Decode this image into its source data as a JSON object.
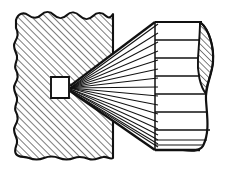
{
  "figure": {
    "canvas": {
      "width": 226,
      "height": 172,
      "background": "#ffffff"
    },
    "stroke_color": "#111111",
    "hatch_color": "#1a1a1a",
    "fill_color": "#ffffff",
    "parts": [
      {
        "name": "wall-block",
        "label": "Hatched wall section",
        "style": "section-hatch-45",
        "break_edges": [
          "top",
          "left",
          "bottom"
        ],
        "straight_edges": [
          "right"
        ],
        "bounds": {
          "x": 14,
          "y": 12,
          "width": 99,
          "height": 148
        }
      },
      {
        "name": "aperture",
        "label": "Rectangular aperture opening",
        "bounds": {
          "x": 51,
          "y": 77,
          "width": 18,
          "height": 21
        }
      },
      {
        "name": "ray-fan",
        "label": "Fan of rays diverging from aperture",
        "apex": {
          "x": 70,
          "y": 88
        },
        "ray_count": 17
      },
      {
        "name": "frustum-body",
        "label": "Cylindrical ribbed body",
        "bounds": {
          "x": 155,
          "y": 22,
          "width": 45,
          "height": 128
        },
        "rib_count": 7
      },
      {
        "name": "end-cap",
        "label": "Hatched elliptical cut section at far end",
        "style": "section-hatch-45"
      }
    ],
    "geometry": {
      "wall_right_edge_x": 113,
      "wall_top_y": 14,
      "wall_bottom_y": 158,
      "wall_left_x": 16,
      "apex_x": 70,
      "apex_y": 88,
      "aperture_left_x": 51,
      "aperture_right_x": 69,
      "aperture_top_y": 77,
      "aperture_bottom_y": 98,
      "cone_top_start_y": 22,
      "cone_bottom_start_y": 150,
      "body_left_x": 155,
      "body_right_x": 200,
      "cap_bulge_x": 214,
      "rib_y_values": [
        22,
        40,
        58,
        76,
        94,
        112,
        130,
        150
      ],
      "fan_end_y_values": [
        24,
        33,
        42,
        51,
        60,
        69,
        78,
        87,
        96,
        105,
        114,
        122,
        130,
        136,
        141,
        145,
        149
      ]
    }
  }
}
